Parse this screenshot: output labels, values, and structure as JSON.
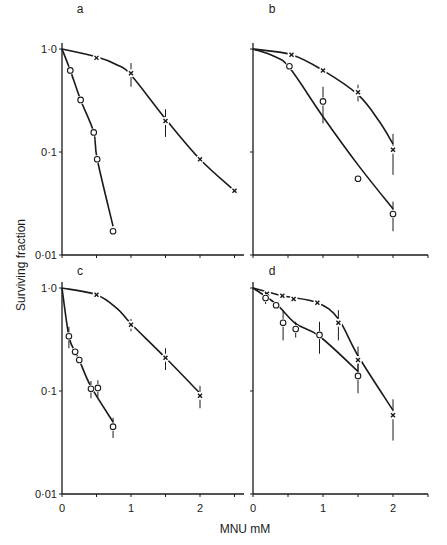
{
  "chart_data": {
    "type": "line",
    "layout": "2x2 panels, log y-axis, shared y-label and x-label",
    "ylabel": "Surviving fraction",
    "xlabel": "MNU  mM",
    "yscale": "log",
    "ylim": [
      0.01,
      1.0
    ],
    "y_ticks": [
      1.0,
      0.1,
      0.01
    ],
    "y_tick_labels": [
      "1·0",
      "0·1",
      "0·01"
    ],
    "x_ticks": [
      0,
      0.5,
      1,
      1.5,
      2,
      2.5
    ],
    "x_tick_labels": [
      "0",
      "1",
      "2"
    ],
    "xlim": [
      0,
      2.6
    ],
    "grid": false,
    "legend": null,
    "panels": [
      {
        "label": "a",
        "series": [
          {
            "name": "crosses",
            "marker": "x",
            "x": [
              0,
              0.5,
              1.0,
              1.5,
              2.0,
              2.5
            ],
            "y": [
              1.0,
              0.82,
              0.58,
              0.2,
              0.085,
              0.042
            ],
            "err": [
              0,
              0,
              0.15,
              0.06,
              0,
              0
            ]
          },
          {
            "name": "circles",
            "marker": "o",
            "x": [
              0,
              0.12,
              0.27,
              0.46,
              0.51,
              0.74
            ],
            "y": [
              1.0,
              0.62,
              0.32,
              0.155,
              0.085,
              0.017
            ],
            "err": [
              0,
              0,
              0,
              0,
              0,
              0
            ]
          }
        ],
        "curves": [
          {
            "series": "crosses",
            "x": [
              0,
              0.5,
              0.8,
              1.0,
              1.5,
              2.0,
              2.5
            ],
            "y": [
              1.0,
              0.84,
              0.7,
              0.56,
              0.21,
              0.085,
              0.042
            ]
          },
          {
            "series": "circles",
            "x": [
              0,
              0.12,
              0.27,
              0.46,
              0.51,
              0.74
            ],
            "y": [
              1.0,
              0.62,
              0.32,
              0.155,
              0.085,
              0.019
            ]
          }
        ]
      },
      {
        "label": "b",
        "series": [
          {
            "name": "crosses",
            "marker": "x",
            "x": [
              0,
              0.55,
              1.0,
              1.5,
              2.0
            ],
            "y": [
              1.0,
              0.88,
              0.62,
              0.38,
              0.105
            ],
            "err": [
              0,
              0,
              0,
              0.07,
              0.045
            ]
          },
          {
            "name": "circles",
            "marker": "o",
            "x": [
              0,
              0.52,
              1.0,
              1.5,
              2.0
            ],
            "y": [
              1.0,
              0.68,
              0.31,
              0.055,
              0.025
            ],
            "err": [
              0,
              0,
              0.12,
              0,
              0.008
            ]
          }
        ],
        "curves": [
          {
            "series": "crosses",
            "x": [
              0,
              0.55,
              1.0,
              1.5,
              1.8,
              2.0
            ],
            "y": [
              1.0,
              0.88,
              0.62,
              0.36,
              0.2,
              0.12
            ]
          },
          {
            "series": "circles",
            "x": [
              0,
              0.3,
              0.52,
              1.0,
              1.5,
              2.0
            ],
            "y": [
              1.0,
              0.85,
              0.66,
              0.22,
              0.075,
              0.028
            ]
          }
        ]
      },
      {
        "label": "c",
        "series": [
          {
            "name": "crosses",
            "marker": "x",
            "x": [
              0,
              0.5,
              1.0,
              1.5,
              2.0
            ],
            "y": [
              1.0,
              0.86,
              0.44,
              0.21,
              0.09
            ],
            "err": [
              0,
              0,
              0.06,
              0.05,
              0.022
            ]
          },
          {
            "name": "circles",
            "marker": "o",
            "x": [
              0,
              0.1,
              0.19,
              0.25,
              0.42,
              0.52,
              0.74
            ],
            "y": [
              1.0,
              0.34,
              0.24,
              0.2,
              0.105,
              0.107,
              0.045
            ],
            "err": [
              0,
              0.08,
              0,
              0,
              0.02,
              0.02,
              0.01
            ]
          }
        ],
        "curves": [
          {
            "series": "crosses",
            "x": [
              0,
              0.5,
              0.8,
              1.0,
              1.5,
              2.0
            ],
            "y": [
              1.0,
              0.86,
              0.63,
              0.45,
              0.21,
              0.095
            ]
          },
          {
            "series": "circles",
            "x": [
              0,
              0.1,
              0.19,
              0.25,
              0.42,
              0.74
            ],
            "y": [
              1.0,
              0.34,
              0.24,
              0.2,
              0.11,
              0.05
            ]
          }
        ]
      },
      {
        "label": "d",
        "series": [
          {
            "name": "crosses",
            "marker": "x",
            "x": [
              0,
              0.2,
              0.42,
              0.58,
              0.92,
              1.22,
              1.5,
              2.0
            ],
            "y": [
              1.0,
              0.88,
              0.84,
              0.78,
              0.72,
              0.46,
              0.2,
              0.058
            ],
            "err": [
              0,
              0,
              0,
              0,
              0,
              0.15,
              0.07,
              0.025
            ]
          },
          {
            "name": "circles",
            "marker": "o",
            "x": [
              0,
              0.18,
              0.33,
              0.43,
              0.61,
              0.95,
              1.5
            ],
            "y": [
              1.0,
              0.8,
              0.68,
              0.46,
              0.4,
              0.35,
              0.14
            ],
            "err": [
              0,
              0.1,
              0,
              0.15,
              0.07,
              0.12,
              0.045
            ]
          }
        ],
        "curves": [
          {
            "series": "crosses",
            "x": [
              0,
              0.42,
              0.92,
              1.22,
              1.5,
              2.0
            ],
            "y": [
              1.0,
              0.84,
              0.72,
              0.5,
              0.22,
              0.065
            ]
          },
          {
            "series": "circles",
            "x": [
              0,
              0.33,
              0.61,
              0.95,
              1.5
            ],
            "y": [
              1.0,
              0.7,
              0.45,
              0.34,
              0.155
            ]
          }
        ]
      }
    ]
  },
  "figure": {
    "ylabel": "Surviving fraction",
    "xlabel": "MNU  mM",
    "y_tick_labels": [
      "1·0",
      "0·1",
      "0·01"
    ],
    "x_tick_labels": [
      "0",
      "1",
      "2"
    ]
  }
}
